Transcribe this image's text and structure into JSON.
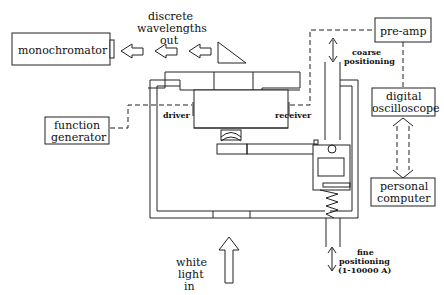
{
  "diagram": {
    "type": "experimental-apparatus-schematic",
    "colors": {
      "line": "#222222",
      "background": "#ffffff"
    },
    "components": {
      "monochromator": {
        "label": "monochromator"
      },
      "pre_amp": {
        "label": "pre-amp"
      },
      "function_generator": {
        "label_line1": "function",
        "label_line2": "generator"
      },
      "digital_oscilloscope": {
        "label_line1": "digital",
        "label_line2": "oscilloscope"
      },
      "personal_computer": {
        "label_line1": "personal",
        "label_line2": "computer"
      }
    },
    "labels": {
      "discrete_wavelengths": {
        "line1": "discrete",
        "line2": "wavelengths",
        "line3": "out"
      },
      "coarse_positioning": {
        "line1": "coarse",
        "line2": "positioning"
      },
      "driver": "driver",
      "receiver": "receiver",
      "white_light": {
        "line1": "white",
        "line2": "light",
        "line3": "in"
      },
      "fine_positioning": {
        "line1": "fine",
        "line2": "positioning",
        "line3": "(1-10000  A)"
      }
    },
    "connections": [
      {
        "from": "function generator",
        "to": "driver",
        "style": "dashed"
      },
      {
        "from": "receiver",
        "to": "pre-amp",
        "style": "dashed"
      },
      {
        "from": "pre-amp",
        "to": "digital oscilloscope",
        "style": "dashed"
      },
      {
        "from": "digital oscilloscope",
        "to": "personal computer",
        "style": "dashed-double-arrow"
      }
    ],
    "arrows": {
      "light_out_count": 3,
      "light_in_count": 1
    }
  }
}
